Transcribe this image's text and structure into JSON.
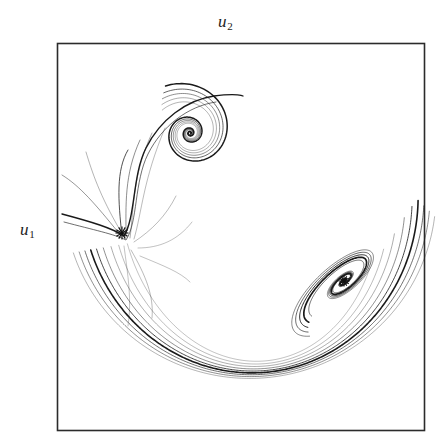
{
  "figure": {
    "type": "phase-portrait",
    "background_color": "#ffffff",
    "frame": {
      "x": 57,
      "y": 43,
      "width": 367,
      "height": 387,
      "border_color": "#2b2b2b",
      "border_width": 1.6
    },
    "labels": {
      "top_axis": {
        "base": "u",
        "subscript": "2",
        "text": "u2"
      },
      "left_axis": {
        "base": "u",
        "subscript": "1",
        "text": "u1"
      }
    }
  },
  "chart_data": {
    "type": "line",
    "title": "",
    "subtitle": "",
    "xlabel": "u2",
    "ylabel": "u1",
    "legend": [],
    "grid": false,
    "axis_ticks": false,
    "xlim": [
      0,
      1
    ],
    "ylim": [
      0,
      1
    ],
    "line_color": "#1a1a1a",
    "markers": [
      {
        "name": "equilibrium-saddle",
        "symbol": "asterisk",
        "x": 122,
        "y": 233,
        "size": 13,
        "color": "#111111"
      },
      {
        "name": "equilibrium-focus",
        "symbol": "asterisk",
        "x": 344,
        "y": 281,
        "size": 11,
        "color": "#111111"
      }
    ],
    "features": [
      {
        "name": "upper-spiral-focus",
        "kind": "spiral",
        "center_x": 190,
        "center_y": 133,
        "turns": 3.4,
        "outer_radius": 52,
        "direction": "inward-counterclockwise"
      },
      {
        "name": "lower-right-spiral-focus",
        "kind": "elliptic-spiral",
        "center_x": 344,
        "center_y": 281,
        "tilt_degrees": -42,
        "turns": 3.0,
        "outer_semi_major": 74,
        "outer_semi_minor": 27,
        "direction": "inward"
      },
      {
        "name": "crescent-trajectory-bundle",
        "kind": "arc-bundle",
        "count": 9,
        "from_x": 62,
        "from_y": 210,
        "to_x": 360,
        "to_y": 300,
        "bottom_y": 385
      }
    ],
    "series": [
      {
        "name": "trajectory-1",
        "stroke_width": 0.7,
        "opacity": 0.95
      },
      {
        "name": "trajectory-2",
        "stroke_width": 0.8,
        "opacity": 0.9
      },
      {
        "name": "trajectory-3",
        "stroke_width": 1.0,
        "opacity": 1.0
      },
      {
        "name": "trajectory-4",
        "stroke_width": 0.7,
        "opacity": 0.8
      },
      {
        "name": "trajectory-5",
        "stroke_width": 0.6,
        "opacity": 0.7
      },
      {
        "name": "trajectory-6",
        "stroke_width": 1.2,
        "opacity": 1.0
      },
      {
        "name": "trajectory-7",
        "stroke_width": 0.6,
        "opacity": 0.65
      },
      {
        "name": "trajectory-8",
        "stroke_width": 0.8,
        "opacity": 0.85
      },
      {
        "name": "trajectory-9",
        "stroke_width": 0.7,
        "opacity": 0.75
      }
    ]
  }
}
